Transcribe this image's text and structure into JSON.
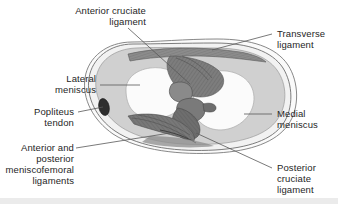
{
  "figure": {
    "view": "superior-view-right-tibial-plateau",
    "colors": {
      "background": "#ffffff",
      "outline": "#6e6e6e",
      "capsule_fill": "#f3f3f3",
      "meniscus_fill": "#cfcfcf",
      "articular_fill": "#fbfbfb",
      "ligament_fill": "#7d7d7d",
      "ligament_dark": "#5c5c5c",
      "popliteus_fill": "#2e2e2e",
      "leader_line": "#585858",
      "text": "#262626",
      "bottom_band": "#ebebeb"
    },
    "structures": [
      {
        "id": "lateral-meniscus",
        "shade": "#cfcfcf"
      },
      {
        "id": "medial-meniscus",
        "shade": "#cfcfcf"
      },
      {
        "id": "anterior-cruciate-ligament",
        "shade": "#7d7d7d"
      },
      {
        "id": "posterior-cruciate-ligament",
        "shade": "#6a6a6a"
      },
      {
        "id": "transverse-ligament",
        "shade": "#8a8a8a"
      },
      {
        "id": "meniscofemoral-ligaments",
        "shade": "#707070"
      },
      {
        "id": "popliteus-tendon",
        "shade": "#2e2e2e"
      }
    ]
  },
  "labels": {
    "anterior_cruciate_ligament": "Anterior cruciate\nligament",
    "transverse_ligament": "Transverse\nligament",
    "lateral_meniscus": "Lateral\nmeniscus",
    "popliteus_tendon": "Popliteus\ntendon",
    "medial_meniscus": "Medial\nmeniscus",
    "meniscofemoral_ligaments": "Anterior and\nposterior\nmeniscofemoral\nligaments",
    "posterior_cruciate_ligament": "Posterior\ncruciate\nligament"
  }
}
